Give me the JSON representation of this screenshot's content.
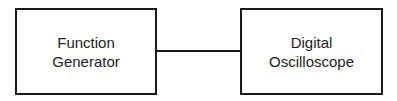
{
  "diagram": {
    "nodes": [
      {
        "id": "function-generator",
        "label": "Function\nGenerator"
      },
      {
        "id": "digital-oscilloscope",
        "label": "Digital\nOscilloscope"
      }
    ],
    "edges": [
      {
        "from": "function-generator",
        "to": "digital-oscilloscope"
      }
    ]
  }
}
